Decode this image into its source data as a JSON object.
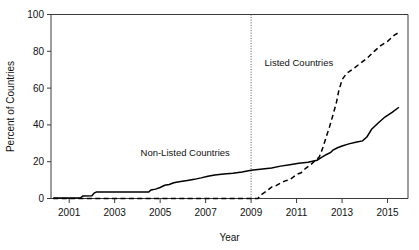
{
  "chart_data": {
    "type": "line",
    "title": "",
    "xlabel": "Year",
    "ylabel": "Percent of Countries",
    "xlim": [
      2000.2,
      2015.9
    ],
    "ylim": [
      0,
      100
    ],
    "grid": false,
    "legend_position": "inline-annotations",
    "xticks": [
      2001,
      2003,
      2005,
      2007,
      2009,
      2011,
      2013,
      2015
    ],
    "xticklabels": [
      "2001",
      "2003",
      "2005",
      "2007",
      "2009",
      "2011",
      "2013",
      "2015"
    ],
    "yticks": [
      0,
      20,
      40,
      60,
      80,
      100
    ],
    "yticklabels": [
      "0",
      "20",
      "40",
      "60",
      "80",
      "100"
    ],
    "annotations": [
      {
        "text": "Listed Countries",
        "x": 2011.1,
        "y": 72
      },
      {
        "text": "Non-Listed Countries",
        "x": 2006.1,
        "y": 23
      },
      {
        "text": "2009 reference line",
        "x": 2009,
        "y": null,
        "style": "vertical dotted"
      }
    ],
    "series": [
      {
        "name": "Non-Listed Countries",
        "style": "solid",
        "x": [
          2000.3,
          2001.0,
          2001.5,
          2001.6,
          2002.0,
          2002.1,
          2002.2,
          2004.5,
          2004.6,
          2004.8,
          2005.0,
          2005.2,
          2005.4,
          2005.6,
          2005.9,
          2006.2,
          2006.5,
          2006.8,
          2007.1,
          2007.4,
          2007.8,
          2008.2,
          2008.6,
          2009.0,
          2009.4,
          2009.9,
          2010.3,
          2010.7,
          2011.1,
          2011.5,
          2011.9,
          2012.1,
          2012.3,
          2012.5,
          2012.6,
          2012.8,
          2013.0,
          2013.3,
          2013.6,
          2013.9,
          2014.1,
          2014.3,
          2014.6,
          2014.9,
          2015.2,
          2015.5
        ],
        "y": [
          0.3,
          0.3,
          0.4,
          1.4,
          1.5,
          3.0,
          3.6,
          3.6,
          4.6,
          5.1,
          6.0,
          7.2,
          7.6,
          8.6,
          9.2,
          9.8,
          10.4,
          11.2,
          12.1,
          12.8,
          13.3,
          13.7,
          14.4,
          15.3,
          15.9,
          16.6,
          17.6,
          18.3,
          19.1,
          19.7,
          20.8,
          22.3,
          23.8,
          25.0,
          26.3,
          27.6,
          28.5,
          29.7,
          30.6,
          31.3,
          33.6,
          37.6,
          41.2,
          44.4,
          46.8,
          49.6
        ]
      },
      {
        "name": "Listed Countries",
        "style": "dashed",
        "x": [
          2000.3,
          2009.3,
          2009.45,
          2009.7,
          2009.9,
          2010.1,
          2010.3,
          2010.5,
          2010.7,
          2010.85,
          2011.0,
          2011.2,
          2011.4,
          2011.6,
          2011.8,
          2012.0,
          2012.15,
          2012.3,
          2012.45,
          2012.6,
          2012.75,
          2012.85,
          2013.0,
          2013.2,
          2013.5,
          2013.8,
          2014.1,
          2014.4,
          2014.7,
          2015.0,
          2015.3,
          2015.55
        ],
        "y": [
          0.0,
          0.0,
          2.1,
          4.2,
          6.2,
          7.0,
          8.4,
          9.6,
          10.2,
          11.6,
          13.1,
          14.0,
          16.4,
          18.1,
          20.4,
          22.6,
          27.4,
          33.4,
          39.0,
          45.4,
          52.0,
          58.2,
          64.6,
          68.0,
          70.6,
          73.4,
          76.2,
          79.8,
          83.1,
          85.4,
          88.8,
          90.6
        ]
      }
    ]
  }
}
